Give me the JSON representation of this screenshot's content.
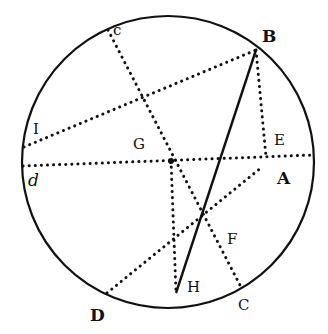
{
  "diagram": {
    "type": "geometric-circle-construction",
    "circle": {
      "cx": 168,
      "cy": 162,
      "r": 146
    },
    "points": {
      "B": [
        256,
        50
      ],
      "c": [
        108,
        30
      ],
      "I": [
        24,
        147
      ],
      "d": [
        23,
        166
      ],
      "A": [
        313,
        155
      ],
      "E": [
        266,
        157
      ],
      "G": [
        171,
        161
      ],
      "F": [
        213,
        239
      ],
      "H": [
        176,
        293
      ],
      "C": [
        241,
        287
      ],
      "D": [
        107,
        293
      ]
    },
    "lines": [
      {
        "from": "c",
        "to": "C",
        "style": "dotted"
      },
      {
        "from": "I",
        "to": "B",
        "style": "dotted"
      },
      {
        "from": "d",
        "to": "A",
        "style": "dotted"
      },
      {
        "from": "B",
        "to": "E",
        "style": "dotted"
      },
      {
        "from": "B",
        "to": "H",
        "style": "solid"
      },
      {
        "from": "G",
        "to": "H",
        "style": "dotted"
      },
      {
        "from": "D",
        "to": "E",
        "style": "dotted"
      }
    ],
    "labels": [
      {
        "text": "B",
        "x": 262,
        "y": 28
      },
      {
        "text": "c",
        "x": 113,
        "y": 25
      },
      {
        "text": "I",
        "x": 33,
        "y": 122
      },
      {
        "text": "G",
        "x": 133,
        "y": 137
      },
      {
        "text": "E",
        "x": 274,
        "y": 133
      },
      {
        "text": "d",
        "x": 28,
        "y": 176
      },
      {
        "text": "A",
        "x": 277,
        "y": 170
      },
      {
        "text": "F",
        "x": 227,
        "y": 232
      },
      {
        "text": "H",
        "x": 187,
        "y": 280
      },
      {
        "text": "C",
        "x": 238,
        "y": 300
      },
      {
        "text": "D",
        "x": 90,
        "y": 309
      }
    ]
  }
}
